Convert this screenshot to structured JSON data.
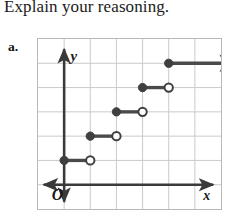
{
  "prompt": {
    "text": "Explain your reasoning."
  },
  "item": {
    "label": "a."
  },
  "chart_data": {
    "type": "line",
    "title": "",
    "subtitle": "",
    "xlabel": "x",
    "ylabel": "y",
    "origin_label": "O",
    "grid": true,
    "legend": "none",
    "xlim": [
      0,
      7
    ],
    "ylim": [
      0,
      7
    ],
    "xticks": [
      0,
      1,
      2,
      3,
      4,
      5,
      6,
      7
    ],
    "yticks": [
      0,
      1,
      2,
      3,
      4,
      5,
      6,
      7
    ],
    "grid_columns": 7,
    "grid_rows": 7,
    "series": [
      {
        "name": "step function",
        "steps": [
          {
            "x_start": 0,
            "x_end": 1,
            "y": 1,
            "left_endpoint": "closed",
            "right_endpoint": "open",
            "ray": false
          },
          {
            "x_start": 1,
            "x_end": 2,
            "y": 2,
            "left_endpoint": "closed",
            "right_endpoint": "open",
            "ray": false
          },
          {
            "x_start": 2,
            "x_end": 3,
            "y": 3,
            "left_endpoint": "closed",
            "right_endpoint": "open",
            "ray": false
          },
          {
            "x_start": 3,
            "x_end": 4,
            "y": 4,
            "left_endpoint": "closed",
            "right_endpoint": "open",
            "ray": false
          },
          {
            "x_start": 4,
            "x_end": 7,
            "y": 5,
            "left_endpoint": "closed",
            "right_endpoint": "arrow",
            "ray": true
          }
        ]
      }
    ],
    "colors": {
      "grid": "#c9c9c9",
      "axis": "#3a3a3a",
      "curve": "#4a4a4a",
      "marker_fill": "#3f3f3f",
      "marker_open_fill": "#ffffff",
      "border": "#b9b9b9",
      "text": "#1a1a1a"
    }
  }
}
